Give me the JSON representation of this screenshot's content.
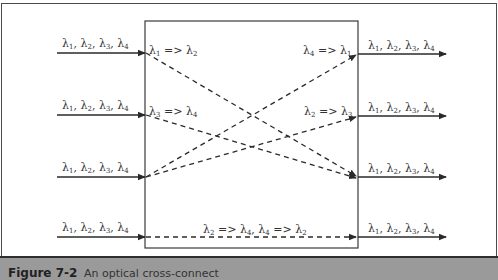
{
  "figure": {
    "number": "Figure 7-2",
    "caption": "An optical cross-connect"
  },
  "inputs": [
    {
      "label": "λ1, λ2, λ3, λ4"
    },
    {
      "label": "λ1, λ2, λ3, λ4"
    },
    {
      "label": "λ1, λ2, λ3, λ4"
    },
    {
      "label": "λ1, λ2, λ3, λ4"
    }
  ],
  "outputs": [
    {
      "label": "λ1, λ2, λ3, λ4"
    },
    {
      "label": "λ1, λ2, λ3, λ4"
    },
    {
      "label": "λ1, λ2, λ3, λ4"
    },
    {
      "label": "λ1, λ2, λ3, λ4"
    }
  ],
  "conversions": {
    "in1": "λ1 => λ2",
    "in2": "λ3 => λ4",
    "out1": "λ4 => λ1",
    "out2": "λ2 => λ3",
    "bottom": "λ2 => λ4, λ4 => λ2"
  },
  "connections": [
    {
      "from": "input-1",
      "to": "output-3"
    },
    {
      "from": "input-2",
      "to": "output-3"
    },
    {
      "from": "input-3",
      "to": "output-1"
    },
    {
      "from": "input-3",
      "to": "output-2"
    },
    {
      "from": "input-4",
      "to": "output-4"
    }
  ]
}
